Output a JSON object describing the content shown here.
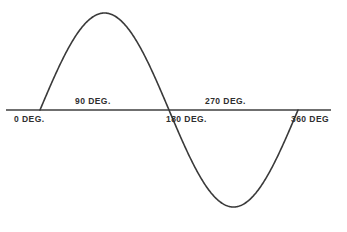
{
  "figure": {
    "background_color": "#ffffff",
    "line_color": "#3a3a3a",
    "text_color": "#2f2f2f",
    "axis_color": "#3f3f3f"
  },
  "labels": {
    "deg0": "0 DEG.",
    "deg90": "90 DEG.",
    "deg180": "180 DEG.",
    "deg270": "270 DEG.",
    "deg360": "360 DEG"
  },
  "chart_data": {
    "type": "line",
    "title": "",
    "xlabel": "",
    "ylabel": "",
    "grid": false,
    "legend": null,
    "xlim": [
      0,
      360
    ],
    "ylim": [
      -1,
      1
    ],
    "xtick_labels": [
      "0 DEG.",
      "90 DEG.",
      "180 DEG.",
      "270 DEG.",
      "360 DEG"
    ],
    "xticks": [
      0,
      90,
      180,
      270,
      360
    ],
    "series": [
      {
        "name": "sine",
        "x": [
          0,
          15,
          30,
          45,
          60,
          75,
          90,
          105,
          120,
          135,
          150,
          165,
          180,
          195,
          210,
          225,
          240,
          255,
          270,
          285,
          300,
          315,
          330,
          345,
          360
        ],
        "values": [
          0,
          0.259,
          0.5,
          0.707,
          0.866,
          0.966,
          1,
          0.966,
          0.866,
          0.707,
          0.5,
          0.259,
          0,
          -0.259,
          -0.5,
          -0.707,
          -0.866,
          -0.966,
          -1,
          -0.966,
          -0.866,
          -0.707,
          -0.5,
          -0.259,
          0
        ]
      }
    ],
    "annotations": [
      {
        "text": "0 DEG.",
        "x": 0,
        "y": 0,
        "position": "below-axis"
      },
      {
        "text": "90 DEG.",
        "x": 90,
        "y": 0,
        "position": "above-axis"
      },
      {
        "text": "180 DEG.",
        "x": 180,
        "y": 0,
        "position": "below-axis"
      },
      {
        "text": "270 DEG.",
        "x": 270,
        "y": 0,
        "position": "above-axis"
      },
      {
        "text": "360 DEG",
        "x": 360,
        "y": 0,
        "position": "below-axis"
      }
    ]
  }
}
